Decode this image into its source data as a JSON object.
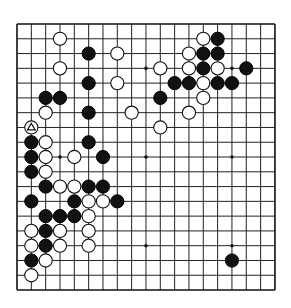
{
  "board": {
    "size": 19,
    "background": "#ffffff",
    "line_color": "#222222",
    "origin": {
      "x": 17,
      "y": 24
    },
    "spacing": {
      "x": 14.33,
      "y": 14.78
    },
    "stone_radius": 6.6,
    "hoshi": [
      [
        3,
        3
      ],
      [
        9,
        3
      ],
      [
        15,
        3
      ],
      [
        3,
        9
      ],
      [
        9,
        9
      ],
      [
        15,
        9
      ],
      [
        3,
        15
      ],
      [
        9,
        15
      ],
      [
        15,
        15
      ]
    ],
    "stones": [
      {
        "c": 3,
        "r": 1,
        "color": "white"
      },
      {
        "c": 13,
        "r": 1,
        "color": "white"
      },
      {
        "c": 14,
        "r": 1,
        "color": "black"
      },
      {
        "c": 5,
        "r": 2,
        "color": "black"
      },
      {
        "c": 7,
        "r": 2,
        "color": "white"
      },
      {
        "c": 12,
        "r": 2,
        "color": "white"
      },
      {
        "c": 13,
        "r": 2,
        "color": "black"
      },
      {
        "c": 14,
        "r": 2,
        "color": "black"
      },
      {
        "c": 3,
        "r": 3,
        "color": "white"
      },
      {
        "c": 10,
        "r": 3,
        "color": "white"
      },
      {
        "c": 12,
        "r": 3,
        "color": "white"
      },
      {
        "c": 13,
        "r": 3,
        "color": "black"
      },
      {
        "c": 14,
        "r": 3,
        "color": "white"
      },
      {
        "c": 16,
        "r": 3,
        "color": "black"
      },
      {
        "c": 5,
        "r": 4,
        "color": "black"
      },
      {
        "c": 7,
        "r": 4,
        "color": "white"
      },
      {
        "c": 11,
        "r": 4,
        "color": "black"
      },
      {
        "c": 12,
        "r": 4,
        "color": "black"
      },
      {
        "c": 13,
        "r": 4,
        "color": "white"
      },
      {
        "c": 14,
        "r": 4,
        "color": "black"
      },
      {
        "c": 15,
        "r": 4,
        "color": "black"
      },
      {
        "c": 2,
        "r": 5,
        "color": "black"
      },
      {
        "c": 3,
        "r": 5,
        "color": "black"
      },
      {
        "c": 10,
        "r": 5,
        "color": "black"
      },
      {
        "c": 13,
        "r": 5,
        "color": "white"
      },
      {
        "c": 2,
        "r": 6,
        "color": "white"
      },
      {
        "c": 5,
        "r": 6,
        "color": "black"
      },
      {
        "c": 8,
        "r": 6,
        "color": "white"
      },
      {
        "c": 12,
        "r": 6,
        "color": "white"
      },
      {
        "c": 1,
        "r": 7,
        "color": "white",
        "marker": "triangle"
      },
      {
        "c": 10,
        "r": 7,
        "color": "white"
      },
      {
        "c": 1,
        "r": 8,
        "color": "black"
      },
      {
        "c": 2,
        "r": 8,
        "color": "white"
      },
      {
        "c": 5,
        "r": 8,
        "color": "black"
      },
      {
        "c": 1,
        "r": 9,
        "color": "black"
      },
      {
        "c": 2,
        "r": 9,
        "color": "white"
      },
      {
        "c": 4,
        "r": 9,
        "color": "white"
      },
      {
        "c": 6,
        "r": 9,
        "color": "black"
      },
      {
        "c": 1,
        "r": 10,
        "color": "black"
      },
      {
        "c": 2,
        "r": 10,
        "color": "white"
      },
      {
        "c": 2,
        "r": 11,
        "color": "black"
      },
      {
        "c": 3,
        "r": 11,
        "color": "white"
      },
      {
        "c": 4,
        "r": 11,
        "color": "white"
      },
      {
        "c": 5,
        "r": 11,
        "color": "black"
      },
      {
        "c": 6,
        "r": 11,
        "color": "black"
      },
      {
        "c": 1,
        "r": 12,
        "color": "black"
      },
      {
        "c": 4,
        "r": 12,
        "color": "black"
      },
      {
        "c": 5,
        "r": 12,
        "color": "white"
      },
      {
        "c": 6,
        "r": 12,
        "color": "white"
      },
      {
        "c": 7,
        "r": 12,
        "color": "black"
      },
      {
        "c": 2,
        "r": 13,
        "color": "black"
      },
      {
        "c": 3,
        "r": 13,
        "color": "black"
      },
      {
        "c": 4,
        "r": 13,
        "color": "black"
      },
      {
        "c": 5,
        "r": 13,
        "color": "white"
      },
      {
        "c": 1,
        "r": 14,
        "color": "white"
      },
      {
        "c": 2,
        "r": 14,
        "color": "black"
      },
      {
        "c": 3,
        "r": 14,
        "color": "white"
      },
      {
        "c": 5,
        "r": 14,
        "color": "white"
      },
      {
        "c": 1,
        "r": 15,
        "color": "white"
      },
      {
        "c": 2,
        "r": 15,
        "color": "black"
      },
      {
        "c": 3,
        "r": 15,
        "color": "white"
      },
      {
        "c": 5,
        "r": 15,
        "color": "white"
      },
      {
        "c": 1,
        "r": 16,
        "color": "black"
      },
      {
        "c": 2,
        "r": 16,
        "color": "white"
      },
      {
        "c": 15,
        "r": 16,
        "color": "black"
      },
      {
        "c": 1,
        "r": 17,
        "color": "white"
      }
    ],
    "last_move_marker": {
      "c": 1,
      "r": 7,
      "shape": "triangle",
      "icon": "triangle-marker-icon"
    }
  }
}
